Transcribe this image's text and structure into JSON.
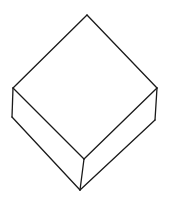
{
  "drawing": {
    "subject": "isometric box (cube) line sketch",
    "stroke_color": "#1a1a1a",
    "background_color": "#ffffff",
    "vertices": {
      "top": [
        87,
        15
      ],
      "left_top": [
        13,
        88
      ],
      "right_top": [
        157,
        88
      ],
      "front_top": [
        84,
        159
      ],
      "left_bottom": [
        12,
        117
      ],
      "right_bottom": [
        155,
        120
      ],
      "front_bottom": [
        80,
        190
      ]
    },
    "edges": [
      {
        "name": "top-left-edge",
        "from": "top",
        "to": "left_top"
      },
      {
        "name": "top-right-edge",
        "from": "top",
        "to": "right_top"
      },
      {
        "name": "front-left-top-edge",
        "from": "left_top",
        "to": "front_top"
      },
      {
        "name": "front-right-top-edge",
        "from": "right_top",
        "to": "front_top"
      },
      {
        "name": "left-vertical-edge",
        "from": "left_top",
        "to": "left_bottom"
      },
      {
        "name": "right-vertical-edge",
        "from": "right_top",
        "to": "right_bottom"
      },
      {
        "name": "front-vertical-edge",
        "from": "front_top",
        "to": "front_bottom"
      },
      {
        "name": "bottom-left-edge",
        "from": "left_bottom",
        "to": "front_bottom"
      },
      {
        "name": "bottom-right-edge",
        "from": "right_bottom",
        "to": "front_bottom"
      }
    ]
  }
}
